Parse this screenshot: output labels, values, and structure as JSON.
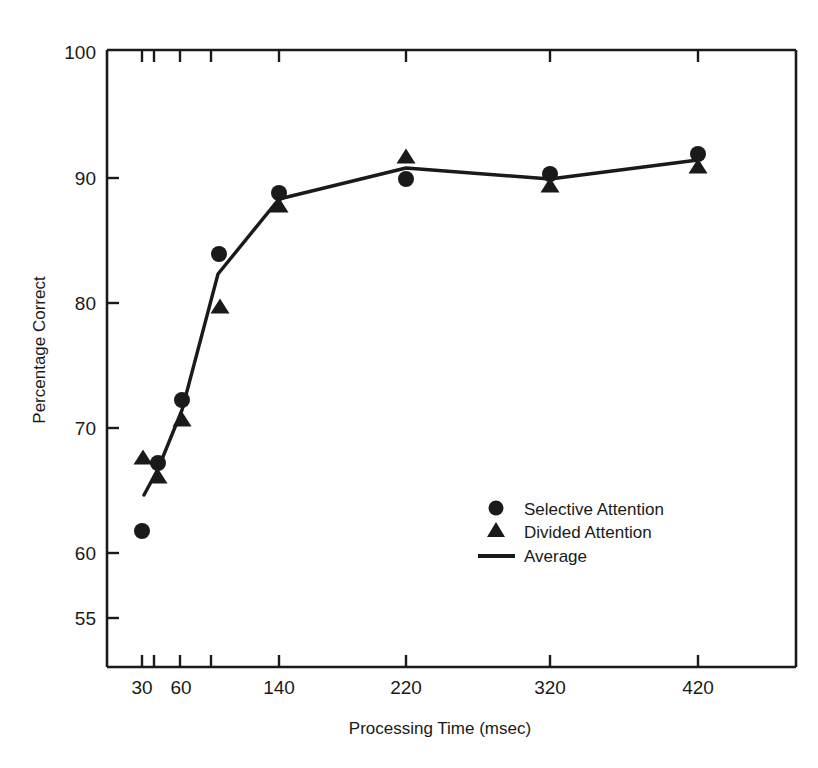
{
  "chart_data": {
    "type": "scatter",
    "title": "",
    "xlabel": "Processing Time (msec)",
    "ylabel": "Percentage Correct",
    "grid": false,
    "legend_position": "center-right-inside",
    "x_tick_labels": [
      "30",
      "60",
      "140",
      "220",
      "320",
      "420"
    ],
    "x_tick_positions_px": [
      142,
      153,
      180,
      211,
      279,
      406,
      550,
      698
    ],
    "x_labeled_positions_px": [
      142,
      180,
      279,
      406,
      550,
      698
    ],
    "y_tick_labels": [
      "100",
      "90",
      "80",
      "70",
      "60",
      "55"
    ],
    "y_tick_values": [
      100,
      90,
      80,
      70,
      60,
      55
    ],
    "y_tick_positions_px": [
      53,
      178,
      303,
      428,
      553,
      618
    ],
    "ylim": [
      55,
      100
    ],
    "axis_note": "Y axis is broken/compressed between 60 and 55; X axis is non-linear (condition ordinal spacing)",
    "series": [
      {
        "name": "Selective Attention",
        "marker": "circle",
        "points": [
          {
            "x_label": "30",
            "x_px": 142,
            "y_px": 531,
            "value": 62.0
          },
          {
            "x_label": "40",
            "x_px": 158,
            "y_px": 463,
            "value": 67.4
          },
          {
            "x_label": "60",
            "x_px": 182,
            "y_px": 400,
            "value": 72.5
          },
          {
            "x_label": "90",
            "x_px": 219,
            "y_px": 254,
            "value": 83.9
          },
          {
            "x_label": "140",
            "x_px": 279,
            "y_px": 193,
            "value": 88.6
          },
          {
            "x_label": "220",
            "x_px": 406,
            "y_px": 179,
            "value": 89.8
          },
          {
            "x_label": "320",
            "x_px": 550,
            "y_px": 174,
            "value": 90.1
          },
          {
            "x_label": "420",
            "x_px": 698,
            "y_px": 154,
            "value": 91.6
          }
        ]
      },
      {
        "name": "Divided Attention",
        "marker": "triangle",
        "points": [
          {
            "x_label": "30",
            "x_px": 143,
            "y_px": 457,
            "value": 68.0
          },
          {
            "x_label": "40",
            "x_px": 158,
            "y_px": 476,
            "value": 66.5
          },
          {
            "x_label": "60",
            "x_px": 182,
            "y_px": 419,
            "value": 71.0
          },
          {
            "x_label": "90",
            "x_px": 220,
            "y_px": 306,
            "value": 79.8
          },
          {
            "x_label": "140",
            "x_px": 279,
            "y_px": 205,
            "value": 87.8
          },
          {
            "x_label": "220",
            "x_px": 406,
            "y_px": 156,
            "value": 91.6
          },
          {
            "x_label": "320",
            "x_px": 550,
            "y_px": 185,
            "value": 89.4
          },
          {
            "x_label": "420",
            "x_px": 698,
            "y_px": 166,
            "value": 90.7
          }
        ]
      },
      {
        "name": "Average",
        "marker": "line",
        "points": [
          {
            "x_label": "30",
            "x_px": 144,
            "y_px": 495,
            "value": 65.0
          },
          {
            "x_label": "40",
            "x_px": 158,
            "y_px": 469,
            "value": 67.0
          },
          {
            "x_label": "60",
            "x_px": 182,
            "y_px": 410,
            "value": 71.8
          },
          {
            "x_label": "90",
            "x_px": 218,
            "y_px": 274,
            "value": 82.3
          },
          {
            "x_label": "140",
            "x_px": 279,
            "y_px": 199,
            "value": 88.2
          },
          {
            "x_label": "220",
            "x_px": 406,
            "y_px": 168,
            "value": 90.7
          },
          {
            "x_label": "320",
            "x_px": 550,
            "y_px": 179,
            "value": 89.8
          },
          {
            "x_label": "420",
            "x_px": 698,
            "y_px": 160,
            "value": 91.2
          }
        ]
      }
    ]
  },
  "legend": {
    "items": [
      {
        "label": "Selective Attention",
        "marker": "circle"
      },
      {
        "label": "Divided Attention",
        "marker": "triangle"
      },
      {
        "label": "Average",
        "marker": "line"
      }
    ]
  },
  "axes": {
    "x_title": "Processing Time (msec)",
    "y_title": "Percentage Correct"
  },
  "tick_text": {
    "y0": "100",
    "y1": "90",
    "y2": "80",
    "y3": "70",
    "y4": "60",
    "y5": "55",
    "x0": "30",
    "x1": "60",
    "x2": "140",
    "x3": "220",
    "x4": "320",
    "x5": "420"
  },
  "colors": {
    "ink": "#1a1a1a",
    "background": "#ffffff"
  }
}
